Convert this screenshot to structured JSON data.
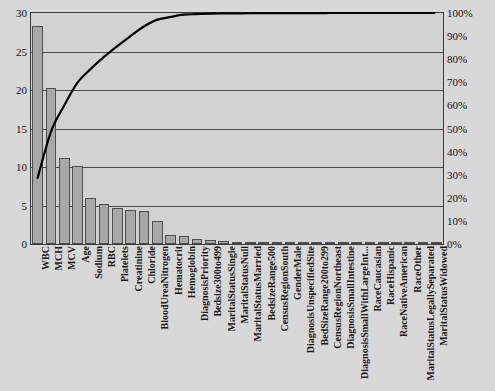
{
  "chart_data": {
    "type": "bar",
    "title": "",
    "subtitle": "",
    "xlabel": "",
    "ylabel": "",
    "y2label": "",
    "ylim": [
      0,
      30
    ],
    "y2lim": [
      0,
      100
    ],
    "grid": true,
    "legend": "none",
    "yticks": [
      "0",
      "5",
      "10",
      "15",
      "20",
      "25",
      "30"
    ],
    "ytick_values": [
      0,
      5,
      10,
      15,
      20,
      25,
      30
    ],
    "y2ticks": [
      "0%",
      "10%",
      "20%",
      "30%",
      "40%",
      "50%",
      "60%",
      "70%",
      "80%",
      "90%",
      "100%"
    ],
    "y2tick_values": [
      0,
      10,
      20,
      30,
      40,
      50,
      60,
      70,
      80,
      90,
      100
    ],
    "categories": [
      "WBC",
      "MCH",
      "MCV",
      "Age",
      "Sodium",
      "RBC",
      "Platelets",
      "Creatinine",
      "Chloride",
      "BloodUreaNitrogen",
      "Hematocrit",
      "Hemoglobin",
      "DiagnosisPriority",
      "Bedsize300to499",
      "MaritalStatusSingle",
      "MaritalStatusNull",
      "MaritalStatusMarried",
      "BedsizeRange500",
      "CensusRegionSouth",
      "GenderMale",
      "DiagnosisUnspecifiedSite",
      "BedSizeRange200to299",
      "CensusRegionNortheast",
      "DiagnosisSmallIntestine",
      "DiagnosisSmallWithLargeInt...",
      "RaceCaucasian",
      "RaceHispanic",
      "RaceNativeAmerican",
      "RaceOther",
      "MaritalStatusLegallySeparated",
      "MaritalStatusWidowed"
    ],
    "series": [
      {
        "name": "Importance",
        "type": "bar",
        "axis": "left",
        "values": [
          28.3,
          20.2,
          11.2,
          10.1,
          6.0,
          5.2,
          4.7,
          4.4,
          4.3,
          3.0,
          1.2,
          1.1,
          0.6,
          0.5,
          0.4,
          0.3,
          0.2,
          0.15,
          0.1,
          0.08,
          0.06,
          0.05,
          0.04,
          0.03,
          0.02,
          0.02,
          0.01,
          0.01,
          0.01,
          0.005,
          0.005
        ]
      },
      {
        "name": "Cumulative %",
        "type": "line",
        "axis": "right",
        "values": [
          28.0,
          48.0,
          59.5,
          69.5,
          75.5,
          80.7,
          85.4,
          89.8,
          94.0,
          97.0,
          98.2,
          99.3,
          99.5,
          99.7,
          99.8,
          99.85,
          99.9,
          99.92,
          99.94,
          99.96,
          99.97,
          99.98,
          99.985,
          99.99,
          99.992,
          99.994,
          99.996,
          99.997,
          99.998,
          99.999,
          100.0
        ]
      }
    ],
    "colors": {
      "bar_fill": "#a8a8a8",
      "bar_stroke": "#4d4d4d",
      "line": "#000000",
      "plot_background": "#d2d2d2",
      "page_background": "#d8d8d8",
      "gridline": "#4a4a4a",
      "axis_text": "#111111"
    }
  }
}
